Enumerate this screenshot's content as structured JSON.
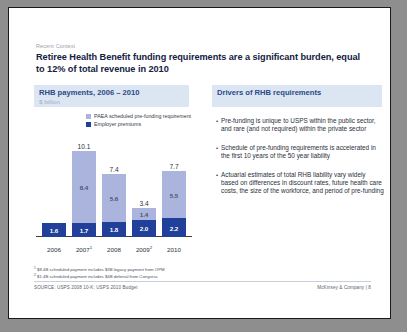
{
  "slide": {
    "eyebrow": "Recent Context",
    "headline": "Retiree Health Benefit funding requirements are a significant burden, equal to 12% of total revenue in 2010"
  },
  "left_panel": {
    "title": "RHB payments, 2006 – 2010",
    "subtitle": "$ billion",
    "legend": [
      {
        "label": "PAEA scheduled pre-funding requirement",
        "color": "#aab4dd"
      },
      {
        "label": "Employer premiums",
        "color": "#20409a"
      }
    ]
  },
  "right_panel": {
    "title": "Drivers of RHB requirements",
    "bullets": [
      "Pre-funding is unique to USPS within the public sector, and rare (and not required) within the private sector",
      "Schedule of pre-funding requirements is accelerated in the first 10 years of the 50 year liability",
      "Actuarial estimates of total RHB liability vary widely based on differences in discount rates, future health care costs, the size of the workforce, and period of pre-funding"
    ]
  },
  "footnotes": [
    "1 $8.4B scheduled payment includes $3B legacy payment from OPM",
    "2 $1.4B scheduled payment includes $4B deferral from Congress"
  ],
  "footer": {
    "source": "SOURCE: USPS 2008 10-K; USPS 2010 Budget",
    "brand": "McKinsey & Company",
    "separator": "|",
    "page": "8"
  },
  "chart_data": {
    "type": "bar",
    "title": "RHB payments, 2006 – 2010",
    "subtitle": "$ billion",
    "xlabel": "",
    "ylabel": "$ billion",
    "ylim": [
      0,
      10.1
    ],
    "grid": false,
    "stacked": true,
    "legend_position": "top",
    "categories": [
      "2006",
      "2007",
      "2008",
      "2009",
      "2010"
    ],
    "category_labels": [
      "2006",
      "2007¹",
      "2008",
      "2009²",
      "2010"
    ],
    "series": [
      {
        "name": "Employer premiums",
        "color": "#20409a",
        "values": [
          1.6,
          1.7,
          1.8,
          2.0,
          2.2
        ]
      },
      {
        "name": "PAEA scheduled pre-funding requirement",
        "color": "#aab4dd",
        "values": [
          0,
          8.4,
          5.6,
          1.4,
          5.5
        ]
      }
    ],
    "totals": [
      null,
      10.1,
      7.4,
      3.4,
      7.7
    ],
    "bars": [
      {
        "category": "2006",
        "label": "2006",
        "dark": "1.6",
        "light": null,
        "total": null,
        "dark_val": 1.6,
        "light_val": 0
      },
      {
        "category": "2007",
        "label": "2007¹",
        "dark": "1.7",
        "light": "8.4",
        "total": "10.1",
        "dark_val": 1.7,
        "light_val": 8.4
      },
      {
        "category": "2008",
        "label": "2008",
        "dark": "1.8",
        "light": "5.6",
        "total": "7.4",
        "dark_val": 1.8,
        "light_val": 5.6
      },
      {
        "category": "2009",
        "label": "2009²",
        "dark": "2.0",
        "light": "1.4",
        "total": "3.4",
        "dark_val": 2.0,
        "light_val": 1.4
      },
      {
        "category": "2010",
        "label": "2010",
        "dark": "2.2",
        "light": "5.5",
        "total": "7.7",
        "dark_val": 2.2,
        "light_val": 5.5
      }
    ]
  }
}
